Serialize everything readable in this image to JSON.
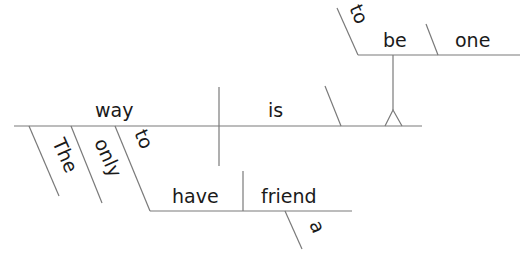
{
  "diagram": {
    "type": "reed-kellogg-sentence-diagram",
    "sentence": "The only way to have a friend is to be one",
    "words": {
      "subject": "way",
      "verb": "is",
      "modifier_the": "The",
      "modifier_only": "only",
      "infinitive_to_1": "to",
      "infinitive_verb_1": "have",
      "object_1": "friend",
      "article_a": "a",
      "infinitive_to_2": "to",
      "infinitive_verb_2": "be",
      "complement_2": "one"
    },
    "line_color": "#7a7a7a",
    "text_color": "#1a1a1a"
  }
}
